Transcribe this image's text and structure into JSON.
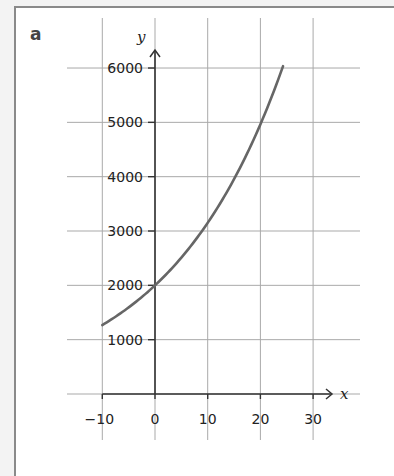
{
  "panel": {
    "label": "a"
  },
  "chart_data": {
    "type": "line",
    "title": "",
    "xlabel": "x",
    "ylabel": "y",
    "xlim": [
      -10,
      30
    ],
    "ylim": [
      0,
      6000
    ],
    "x_ticks": [
      -10,
      0,
      10,
      20,
      30
    ],
    "y_ticks": [
      1000,
      2000,
      3000,
      4000,
      5000,
      6000
    ],
    "x_tick_labels": [
      "−10",
      "0",
      "10",
      "20",
      "30"
    ],
    "y_tick_labels": [
      "1000",
      "2000",
      "3000",
      "4000",
      "5000",
      "6000"
    ],
    "grid": true,
    "legend": null,
    "curve_equation": "y = 2000 * 1.0465^x",
    "series": [
      {
        "name": "curve",
        "color": "#666666",
        "x": [
          -10,
          -5,
          0,
          5,
          10,
          15,
          20,
          24.3
        ],
        "y": [
          1270,
          1590,
          2000,
          2510,
          3150,
          3950,
          4960,
          6000
        ]
      }
    ]
  }
}
